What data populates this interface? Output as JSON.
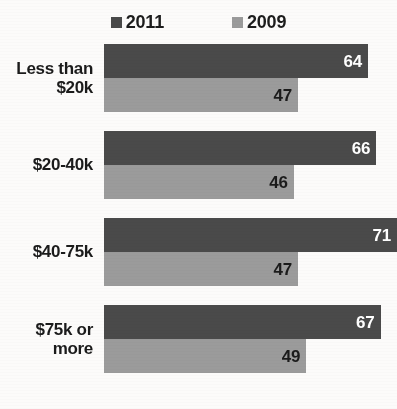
{
  "legend": {
    "position": "top-center",
    "entries": [
      {
        "label": "2011",
        "color": "#4a4a4a",
        "marker": "square-marker-icon"
      },
      {
        "label": "2009",
        "color": "#9b9b9b",
        "marker": "square-marker-icon"
      }
    ]
  },
  "colors": {
    "series_2011": "#4a4a4a",
    "series_2009": "#9b9b9b",
    "background": "#fcfbfa",
    "label_text": "#1b1b1b",
    "value_on_dark": "#ffffff",
    "value_on_light": "#1b1b1b"
  },
  "chart_data": {
    "type": "bar",
    "orientation": "horizontal",
    "title": "",
    "subtitle": "",
    "xlabel": "",
    "ylabel": "",
    "xlim": [
      0,
      72
    ],
    "grid": false,
    "legend_position": "top-center",
    "categories": [
      "Less than $20k",
      "$20-40k",
      "$40-75k",
      "$75k or more"
    ],
    "series": [
      {
        "name": "2011",
        "color": "#4a4a4a",
        "values": [
          64,
          66,
          71,
          67
        ]
      },
      {
        "name": "2009",
        "color": "#9b9b9b",
        "values": [
          47,
          46,
          47,
          49
        ]
      }
    ]
  },
  "groups": [
    {
      "category_line1": "Less than",
      "category_line2": "$20k",
      "bar_2011": {
        "value": "64",
        "width_pct": 90.1
      },
      "bar_2009": {
        "value": "47",
        "width_pct": 66.2
      }
    },
    {
      "category_line1": "$20-40k",
      "category_line2": "",
      "bar_2011": {
        "value": "66",
        "width_pct": 92.9
      },
      "bar_2009": {
        "value": "46",
        "width_pct": 64.8
      }
    },
    {
      "category_line1": "$40-75k",
      "category_line2": "",
      "bar_2011": {
        "value": "71",
        "width_pct": 100.0
      },
      "bar_2009": {
        "value": "47",
        "width_pct": 66.2
      }
    },
    {
      "category_line1": "$75k or",
      "category_line2": "more",
      "bar_2011": {
        "value": "67",
        "width_pct": 94.4
      },
      "bar_2009": {
        "value": "49",
        "width_pct": 69.0
      }
    }
  ]
}
